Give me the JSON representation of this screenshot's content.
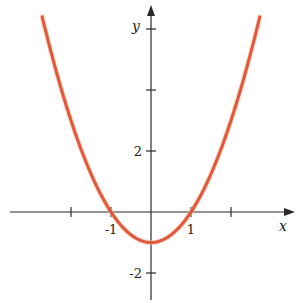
{
  "chart_data": {
    "type": "line",
    "title": "",
    "function": "y = x^2 - 1",
    "xlabel": "x",
    "ylabel": "y",
    "x_ticks": [
      -2,
      -1,
      1,
      2
    ],
    "x_tick_labels": [
      {
        "value": -1,
        "label": "-1"
      },
      {
        "value": 1,
        "label": "1"
      }
    ],
    "y_ticks": [
      -2,
      2,
      4,
      6
    ],
    "y_tick_labels": [
      {
        "value": 2,
        "label": "2"
      },
      {
        "value": -2,
        "label": "-2"
      }
    ],
    "xlim": [
      -3.5,
      3.6
    ],
    "ylim": [
      -2.9,
      6.9
    ],
    "grid": false,
    "legend": null,
    "series": [
      {
        "name": "f(x) = x^2 - 1",
        "color": "#e2573f",
        "x": [
          -2.72,
          -2.5,
          -2,
          -1.5,
          -1,
          -0.5,
          0,
          0.5,
          1,
          1.5,
          2,
          2.5,
          2.72
        ],
        "y": [
          6.4,
          5.25,
          3,
          1.25,
          0,
          -0.75,
          -1,
          -0.75,
          0,
          1.25,
          3,
          5.25,
          6.4
        ]
      }
    ],
    "annotations": {
      "vertex": [
        0,
        -1
      ],
      "x_intercepts": [
        -1,
        1
      ],
      "y_intercept": -1
    }
  },
  "layout": {
    "origin_px": [
      151,
      212
    ],
    "x_px_per_unit": 40,
    "y_px_per_unit": 30.5,
    "x_axis_px": [
      10,
      295
    ],
    "y_axis_px": [
      5,
      300
    ]
  }
}
